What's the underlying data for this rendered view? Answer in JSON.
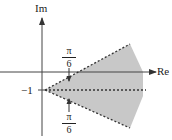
{
  "diagram": {
    "axes": {
      "x_label": "Re",
      "y_label": "Im"
    },
    "point_label": "−1",
    "angles": [
      {
        "position": "upper",
        "numerator": "π",
        "denominator": "6"
      },
      {
        "position": "lower",
        "numerator": "π",
        "denominator": "6"
      }
    ],
    "colors": {
      "region_fill": "#c8c8c8",
      "line": "#333333"
    }
  }
}
